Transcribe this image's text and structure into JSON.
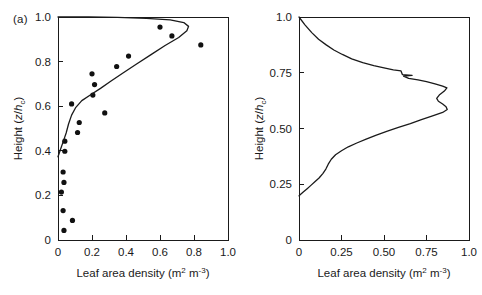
{
  "figure": {
    "panels": [
      {
        "tag": "(a)",
        "x_axis": {
          "title_main": "Leaf area density (m",
          "title_sup1": "2",
          "title_mid": " m",
          "title_sup2": "-3",
          "title_end": ")",
          "ticks": [
            "0",
            "0.2",
            "0.4",
            "0.6",
            "0.8",
            "1.0"
          ],
          "tick_values": [
            0,
            0.2,
            0.4,
            0.6,
            0.8,
            1.0
          ],
          "range": [
            0,
            1.0
          ]
        },
        "y_axis": {
          "title_pre": "Height (",
          "title_var": "z",
          "title_slash": "/",
          "title_var2": "h",
          "title_sub": "c",
          "title_end": ")",
          "ticks": [
            "0",
            "0.2",
            "0.4",
            "0.6",
            "0.8",
            "1.0"
          ],
          "tick_values": [
            0,
            0.2,
            0.4,
            0.6,
            0.8,
            1.0
          ],
          "range": [
            0,
            1.0
          ]
        }
      },
      {
        "tag": "(b)",
        "x_axis": {
          "title_main": "Leaf area density (m",
          "title_sup1": "2",
          "title_mid": " m",
          "title_sup2": "-3",
          "title_end": ")",
          "ticks": [
            "0",
            "0.25",
            "0.50",
            "0.75",
            "1.0"
          ],
          "tick_values": [
            0,
            0.25,
            0.5,
            0.75,
            1.0
          ],
          "range": [
            0,
            1.0
          ]
        },
        "y_axis": {
          "title_pre": "Height (",
          "title_var": "z",
          "title_slash": "/",
          "title_var2": "h",
          "title_sub": "c",
          "title_end": ")",
          "ticks": [
            "0",
            "0.25",
            "0.50",
            "0.75",
            "1.0"
          ],
          "tick_values": [
            0,
            0.25,
            0.5,
            0.75,
            1.0
          ],
          "range": [
            0,
            1.0
          ]
        }
      }
    ]
  },
  "chart_data": [
    {
      "type": "scatter",
      "panel": "(a)",
      "title": "",
      "xlabel": "Leaf area density (m2 m-3)",
      "ylabel": "Height (z/hc)",
      "xlim": [
        0,
        1.0
      ],
      "ylim": [
        0,
        1.0
      ],
      "grid": false,
      "legend": "none",
      "series": [
        {
          "name": "Observed leaf area density",
          "type": "scatter",
          "marker": "filled-circle",
          "color": "#111111",
          "points": [
            [
              0.035,
              0.043
            ],
            [
              0.085,
              0.088
            ],
            [
              0.03,
              0.132
            ],
            [
              0.02,
              0.215
            ],
            [
              0.035,
              0.258
            ],
            [
              0.03,
              0.305
            ],
            [
              0.04,
              0.398
            ],
            [
              0.04,
              0.443
            ],
            [
              0.115,
              0.482
            ],
            [
              0.125,
              0.527
            ],
            [
              0.08,
              0.61
            ],
            [
              0.275,
              0.57
            ],
            [
              0.205,
              0.65
            ],
            [
              0.215,
              0.697
            ],
            [
              0.2,
              0.745
            ],
            [
              0.345,
              0.778
            ],
            [
              0.415,
              0.825
            ],
            [
              0.6,
              0.955
            ],
            [
              0.67,
              0.915
            ],
            [
              0.84,
              0.875
            ]
          ]
        },
        {
          "name": "Fitted profile",
          "type": "line",
          "color": "#1a1a1a",
          "points": [
            [
              0.0,
              0.373
            ],
            [
              0.012,
              0.4
            ],
            [
              0.03,
              0.44
            ],
            [
              0.048,
              0.48
            ],
            [
              0.062,
              0.52
            ],
            [
              0.08,
              0.56
            ],
            [
              0.105,
              0.595
            ],
            [
              0.14,
              0.625
            ],
            [
              0.19,
              0.65
            ],
            [
              0.25,
              0.68
            ],
            [
              0.31,
              0.712
            ],
            [
              0.38,
              0.748
            ],
            [
              0.46,
              0.788
            ],
            [
              0.545,
              0.83
            ],
            [
              0.63,
              0.872
            ],
            [
              0.71,
              0.908
            ],
            [
              0.758,
              0.938
            ],
            [
              0.768,
              0.958
            ],
            [
              0.74,
              0.975
            ],
            [
              0.66,
              0.987
            ],
            [
              0.52,
              0.994
            ],
            [
              0.35,
              0.998
            ],
            [
              0.18,
              1.0
            ],
            [
              0.0,
              1.0
            ]
          ]
        }
      ]
    },
    {
      "type": "line",
      "panel": "(b)",
      "title": "",
      "xlabel": "Leaf area density (m2 m-3)",
      "ylabel": "Height (z/hc)",
      "xlim": [
        0,
        1.0
      ],
      "ylim": [
        0,
        1.0
      ],
      "grid": false,
      "legend": "none",
      "series": [
        {
          "name": "Measured leaf area density profile",
          "type": "line",
          "color": "#1a1a1a",
          "points": [
            [
              0.0,
              1.0
            ],
            [
              0.035,
              0.965
            ],
            [
              0.075,
              0.93
            ],
            [
              0.115,
              0.9
            ],
            [
              0.16,
              0.875
            ],
            [
              0.205,
              0.852
            ],
            [
              0.255,
              0.832
            ],
            [
              0.31,
              0.812
            ],
            [
              0.375,
              0.795
            ],
            [
              0.44,
              0.782
            ],
            [
              0.5,
              0.772
            ],
            [
              0.555,
              0.763
            ],
            [
              0.6,
              0.758
            ],
            [
              0.608,
              0.742
            ],
            [
              0.665,
              0.738
            ],
            [
              0.615,
              0.735
            ],
            [
              0.645,
              0.725
            ],
            [
              0.7,
              0.718
            ],
            [
              0.75,
              0.71
            ],
            [
              0.8,
              0.7
            ],
            [
              0.845,
              0.69
            ],
            [
              0.87,
              0.682
            ],
            [
              0.855,
              0.668
            ],
            [
              0.825,
              0.65
            ],
            [
              0.81,
              0.635
            ],
            [
              0.82,
              0.622
            ],
            [
              0.845,
              0.61
            ],
            [
              0.865,
              0.598
            ],
            [
              0.872,
              0.585
            ],
            [
              0.845,
              0.572
            ],
            [
              0.79,
              0.558
            ],
            [
              0.72,
              0.54
            ],
            [
              0.655,
              0.522
            ],
            [
              0.585,
              0.505
            ],
            [
              0.52,
              0.488
            ],
            [
              0.455,
              0.47
            ],
            [
              0.395,
              0.452
            ],
            [
              0.34,
              0.435
            ],
            [
              0.29,
              0.418
            ],
            [
              0.25,
              0.4
            ],
            [
              0.215,
              0.382
            ],
            [
              0.19,
              0.362
            ],
            [
              0.172,
              0.34
            ],
            [
              0.158,
              0.318
            ],
            [
              0.14,
              0.298
            ],
            [
              0.118,
              0.278
            ],
            [
              0.095,
              0.262
            ],
            [
              0.07,
              0.245
            ],
            [
              0.048,
              0.23
            ],
            [
              0.025,
              0.215
            ],
            [
              0.005,
              0.202
            ],
            [
              0.0,
              0.198
            ]
          ]
        }
      ]
    }
  ]
}
